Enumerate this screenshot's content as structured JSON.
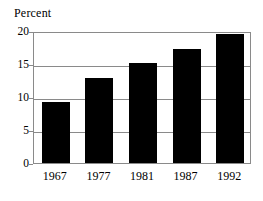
{
  "chart_data": {
    "type": "bar",
    "title": "Percent",
    "xlabel": "",
    "ylabel": "Percent",
    "categories": [
      "1967",
      "1977",
      "1981",
      "1987",
      "1992"
    ],
    "values": [
      9.3,
      12.9,
      15.1,
      17.3,
      19.6
    ],
    "ylim": [
      0,
      20
    ],
    "yticks": [
      "0",
      "5",
      "10",
      "15",
      "20"
    ],
    "ytick_values": [
      0,
      5,
      10,
      15,
      20
    ],
    "grid": true,
    "legend": "none",
    "bar_color": "#000000",
    "frame_color": "#8a8a8a",
    "background": "#ffffff"
  }
}
